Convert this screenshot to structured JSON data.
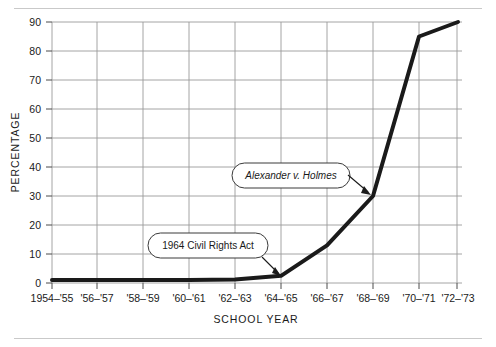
{
  "chart_data": {
    "type": "line",
    "title": "",
    "subtitle": "",
    "xlabel": "SCHOOL  YEAR",
    "ylabel": "PERCENTAGE",
    "x_tick_labels": [
      "1954–'55",
      "'56–'57",
      "'58–'59",
      "'60–'61",
      "'62–'63",
      "'64–'65",
      "'66–'67",
      "'68–'69",
      "'70–'71",
      "'72–'73"
    ],
    "y_tick_labels": [
      "0",
      "10",
      "20",
      "30",
      "40",
      "50",
      "60",
      "70",
      "80",
      "90"
    ],
    "ylim": [
      0,
      90
    ],
    "y_tick_step": 10,
    "grid": true,
    "grid_color": "#9a9a9a",
    "legend": "none",
    "series": [
      {
        "name": "Percentage of Black students in desegregated schools",
        "color": "#1a1a1a",
        "line_width": 4,
        "categories": [
          "1954–'55",
          "'56–'57",
          "'58–'59",
          "'60–'61",
          "'62–'63",
          "'64–'65",
          "'66–'67",
          "'68–'69",
          "'70–'71",
          "'72–'73"
        ],
        "values": [
          1,
          1,
          1,
          1,
          1.2,
          2.5,
          13,
          30,
          85,
          90
        ]
      }
    ],
    "annotations": [
      {
        "id": "civil-rights-act",
        "label": "1964 Civil Rights Act",
        "italic": false,
        "points_to_category": "'64–'65",
        "points_to_value": 2.5
      },
      {
        "id": "alexander-v-holmes",
        "label": "Alexander v. Holmes",
        "italic": true,
        "points_to_category": "'68–'69",
        "points_to_value": 30
      }
    ]
  }
}
